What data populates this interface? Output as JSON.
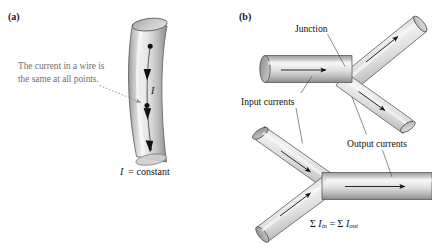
{
  "figure": {
    "background_color": "#ffffff",
    "pipe_fill_light": "#f2f2f2",
    "pipe_fill_mid": "#c9c9c9",
    "pipe_fill_dark": "#8f8f8f",
    "pipe_outline": "#4a4a4a",
    "annotation_color": "#6f6f6f",
    "text_color": "#111111"
  },
  "panel_a": {
    "label": "(a)",
    "annotation": "The current in a wire is\nthe same at all points.",
    "current_symbol": "I",
    "equation": "I = constant",
    "arrow_count": 3,
    "point_count": 2
  },
  "panel_b": {
    "label": "(b)",
    "junction_label": "Junction",
    "input_label": "Input currents",
    "output_label": "Output currents",
    "equation_sigma": "Σ",
    "equation_i": "I",
    "equation_sub_in": "in",
    "equation_eq": "=",
    "equation_sub_out": "out",
    "top_junction": {
      "inputs": 1,
      "outputs": 2
    },
    "bottom_junction": {
      "inputs": 2,
      "outputs": 1
    }
  }
}
